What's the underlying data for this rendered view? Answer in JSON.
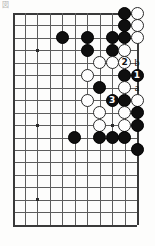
{
  "diagram": {
    "corner_mark": "図",
    "colors": {
      "black_stone": "#0f0f0f",
      "white_stone": "#fefefe",
      "grid_line": "#5d5d5d",
      "board_background": "#fdfdfc",
      "black_label_text": "#ffffff",
      "white_label_text": "#141414"
    }
  },
  "board": {
    "origin_x": 12.5,
    "origin_y": 13,
    "spacing": 12.45,
    "cols": 11,
    "rows": 18,
    "stone_size": 13,
    "edges": {
      "top": true,
      "left": true,
      "right": true,
      "bottom": true
    },
    "hoshi": [
      {
        "col": 2,
        "row": 3
      },
      {
        "col": 2,
        "row": 9
      },
      {
        "col": 2,
        "row": 15
      },
      {
        "col": 8,
        "row": 9
      }
    ]
  },
  "stones": [
    {
      "col": 9,
      "row": 0,
      "color": "black",
      "label": ""
    },
    {
      "col": 10,
      "row": 0,
      "color": "white",
      "label": ""
    },
    {
      "col": 9,
      "row": 1,
      "color": "black",
      "label": ""
    },
    {
      "col": 10,
      "row": 1,
      "color": "white",
      "label": ""
    },
    {
      "col": 4,
      "row": 2,
      "color": "black",
      "label": ""
    },
    {
      "col": 6,
      "row": 2,
      "color": "black",
      "label": ""
    },
    {
      "col": 8,
      "row": 2,
      "color": "black",
      "label": ""
    },
    {
      "col": 9,
      "row": 2,
      "color": "black",
      "label": ""
    },
    {
      "col": 10,
      "row": 2,
      "color": "white",
      "label": ""
    },
    {
      "col": 6,
      "row": 3,
      "color": "black",
      "label": ""
    },
    {
      "col": 8,
      "row": 3,
      "color": "black",
      "label": ""
    },
    {
      "col": 9,
      "row": 3,
      "color": "white",
      "label": ""
    },
    {
      "col": 7,
      "row": 4,
      "color": "white",
      "label": ""
    },
    {
      "col": 8,
      "row": 4,
      "color": "white",
      "label": ""
    },
    {
      "col": 9,
      "row": 4,
      "color": "white",
      "label": "2"
    },
    {
      "col": 6,
      "row": 5,
      "color": "white",
      "label": ""
    },
    {
      "col": 9,
      "row": 5,
      "color": "black",
      "label": ""
    },
    {
      "col": 10,
      "row": 5,
      "color": "black",
      "label": "1"
    },
    {
      "col": 7,
      "row": 6,
      "color": "black",
      "label": ""
    },
    {
      "col": 9,
      "row": 6,
      "color": "white",
      "label": ""
    },
    {
      "col": 6,
      "row": 7,
      "color": "white",
      "label": ""
    },
    {
      "col": 8,
      "row": 7,
      "color": "black",
      "label": "3"
    },
    {
      "col": 9,
      "row": 7,
      "color": "black",
      "label": ""
    },
    {
      "col": 10,
      "row": 7,
      "color": "white",
      "label": ""
    },
    {
      "col": 7,
      "row": 8,
      "color": "white",
      "label": ""
    },
    {
      "col": 9,
      "row": 8,
      "color": "white",
      "label": ""
    },
    {
      "col": 10,
      "row": 8,
      "color": "black",
      "label": ""
    },
    {
      "col": 7,
      "row": 9,
      "color": "white",
      "label": ""
    },
    {
      "col": 9,
      "row": 9,
      "color": "white",
      "label": ""
    },
    {
      "col": 10,
      "row": 9,
      "color": "black",
      "label": ""
    },
    {
      "col": 5,
      "row": 10,
      "color": "black",
      "label": ""
    },
    {
      "col": 7,
      "row": 10,
      "color": "black",
      "label": ""
    },
    {
      "col": 8,
      "row": 10,
      "color": "black",
      "label": ""
    },
    {
      "col": 9,
      "row": 10,
      "color": "black",
      "label": ""
    },
    {
      "col": 10,
      "row": 11,
      "color": "black",
      "label": ""
    }
  ],
  "markers": [
    {
      "col": 10,
      "row": 4,
      "text": "b"
    },
    {
      "col": 10,
      "row": 6,
      "text": "a"
    }
  ]
}
